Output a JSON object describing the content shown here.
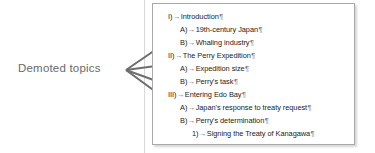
{
  "annotation": {
    "label": "Demoted  topics",
    "color": "#6a6a6a"
  },
  "arrows": {
    "color": "#6e6e6e",
    "count": 4,
    "origin": {
      "x": 126,
      "y": 70
    },
    "targets": [
      {
        "x": 182,
        "y": 31,
        "points_to": "B) Whaling industry"
      },
      {
        "x": 180,
        "y": 62,
        "points_to": "B) Perry's task"
      },
      {
        "x": 186,
        "y": 92,
        "points_to": "A) Japan's response to treaty request"
      },
      {
        "x": 192,
        "y": 118,
        "points_to": "1) Signing the Treaty of Kanagawa"
      }
    ]
  },
  "outline": {
    "marks": {
      "tab": "→",
      "paragraph": "¶"
    },
    "rows": [
      {
        "level": 1,
        "marker": "I)",
        "text": "Introduction"
      },
      {
        "level": 2,
        "marker": "A)",
        "text": "19th-century Japan"
      },
      {
        "level": 2,
        "marker": "B)",
        "text": "Whaling industry"
      },
      {
        "level": 1,
        "marker": "II)",
        "text": "The Perry Expedition"
      },
      {
        "level": 2,
        "marker": "A)",
        "text": "Expedition size"
      },
      {
        "level": 2,
        "marker": "B)",
        "text": "Perry's task"
      },
      {
        "level": 1,
        "marker": "III)",
        "text": "Entering Edo Bay"
      },
      {
        "level": 2,
        "marker": "A)",
        "text": "Japan's response to treaty request"
      },
      {
        "level": 2,
        "marker": "B)",
        "text": "Perry's determination"
      },
      {
        "level": 3,
        "marker": "1)",
        "text": "Signing the Treaty of Kanagawa"
      },
      {
        "level": 3,
        "marker": "2)",
        "text": "Treaty provisions"
      },
      {
        "level": 1,
        "marker": "IV)",
        "text": "Opening Japan to the world"
      }
    ]
  }
}
